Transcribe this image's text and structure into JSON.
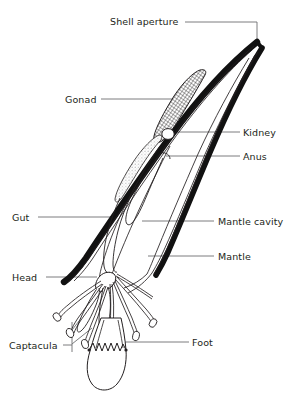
{
  "figure": {
    "type": "anatomical-line-diagram",
    "width": 284,
    "height": 397,
    "background_color": "#ffffff",
    "ink_color": "#231f20",
    "leader_color": "#6d6e71"
  },
  "labels": {
    "shell_aperture": "Shell aperture",
    "gonad": "Gonad",
    "kidney": "Kidney",
    "anus": "Anus",
    "gut": "Gut",
    "mantle_cavity": "Mantle cavity",
    "mantle": "Mantle",
    "head": "Head",
    "captacula": "Captacula",
    "foot": "Foot"
  },
  "label_list": [
    {
      "id": "shell-aperture",
      "text": "Shell aperture",
      "side": "top",
      "x": 110,
      "y": 16
    },
    {
      "id": "gonad",
      "text": "Gonad",
      "side": "left",
      "x": 65,
      "y": 94
    },
    {
      "id": "kidney",
      "text": "Kidney",
      "side": "right",
      "x": 243,
      "y": 127
    },
    {
      "id": "anus",
      "text": "Anus",
      "side": "right",
      "x": 243,
      "y": 151
    },
    {
      "id": "gut",
      "text": "Gut",
      "side": "left",
      "x": 12,
      "y": 212
    },
    {
      "id": "mantle-cavity",
      "text": "Mantle cavity",
      "side": "right",
      "x": 218,
      "y": 216
    },
    {
      "id": "mantle",
      "text": "Mantle",
      "side": "right",
      "x": 218,
      "y": 251
    },
    {
      "id": "head",
      "text": "Head",
      "side": "left",
      "x": 12,
      "y": 272
    },
    {
      "id": "captacula",
      "text": "Captacula",
      "side": "left",
      "x": 9,
      "y": 340
    },
    {
      "id": "foot",
      "text": "Foot",
      "side": "right",
      "x": 192,
      "y": 337
    }
  ],
  "structures": [
    {
      "name": "shell",
      "description": "curved tapering tusk-shaped shell, thick black walls"
    },
    {
      "name": "gonad",
      "description": "cross-hatched elongate organ in upper body"
    },
    {
      "name": "kidney",
      "description": "small oval organ below gonad"
    },
    {
      "name": "anus",
      "description": "opening into mantle cavity"
    },
    {
      "name": "gut",
      "description": "looping digestive tract"
    },
    {
      "name": "mantle-cavity",
      "description": "open space inside mantle"
    },
    {
      "name": "mantle",
      "description": "tissue lining inner shell wall"
    },
    {
      "name": "head",
      "description": "head region at shell aperture"
    },
    {
      "name": "captacula",
      "description": "slender club-tipped feeding tentacles"
    },
    {
      "name": "foot",
      "description": "conical burrowing foot with serrated collar"
    }
  ]
}
